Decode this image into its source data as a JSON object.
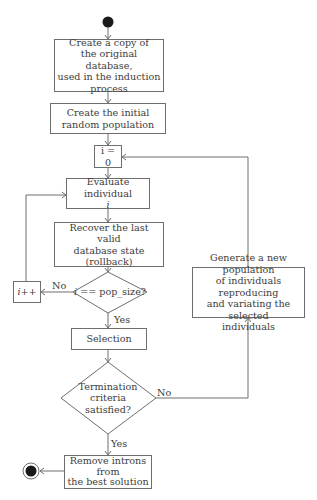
{
  "diagram": {
    "type": "flowchart",
    "start_node": {
      "icon": "start-node-icon"
    },
    "end_node": {
      "icon": "end-node-icon"
    },
    "nodes": {
      "copy_db": "Create a copy of\nthe original database,\nused in the induction\nprocess",
      "init_pop": "Create the initial\nrandom population",
      "init_i": "i = 0",
      "evaluate": "Evaluate individual",
      "evaluate_var": "i",
      "rollback": "Recover the last valid\ndatabase state\n(rollback)",
      "check_pop_var": "i",
      "check_pop": " == pop_size?",
      "increment": "i++",
      "selection": "Selection",
      "termination": "Termination\ncriteria\nsatisfied?",
      "generate": "Generate a new population\nof individuals reproducing\nand variating the selected\nindividuals",
      "remove_introns": "Remove introns\nfrom\nthe best solution"
    },
    "edge_labels": {
      "pop_no": "No",
      "pop_yes": "Yes",
      "term_no": "No",
      "term_yes": "Yes"
    },
    "colors": {
      "stroke": "#6e6e6e",
      "text": "#3c3c3c",
      "node_fill": "#ffffff",
      "terminal_fill": "#1a1a1a"
    }
  }
}
